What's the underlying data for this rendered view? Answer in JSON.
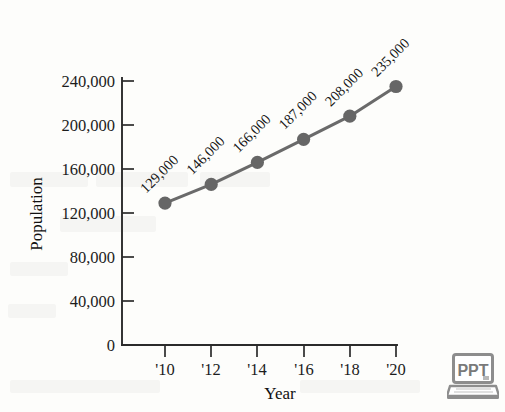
{
  "chart_data": {
    "type": "line",
    "title": "",
    "subtitle": "",
    "xlabel": "Year",
    "ylabel": "Population",
    "categories": [
      "'10",
      "'12",
      "'14",
      "'16",
      "'18",
      "'20"
    ],
    "x": [
      2010,
      2012,
      2014,
      2016,
      2018,
      2020
    ],
    "values": [
      129000,
      146000,
      166000,
      187000,
      208000,
      235000
    ],
    "point_labels": [
      "129,000",
      "146,000",
      "166,000",
      "187,000",
      "208,000",
      "235,000"
    ],
    "series": [
      {
        "name": "Population",
        "values": [
          129000,
          146000,
          166000,
          187000,
          208000,
          235000
        ],
        "color": "#6a6a6a"
      }
    ],
    "ylim": [
      0,
      240000
    ],
    "ytick_values": [
      0,
      40000,
      80000,
      120000,
      160000,
      200000,
      240000
    ],
    "ytick_labels": [
      "0",
      "40,000",
      "80,000",
      "120,000",
      "160,000",
      "200,000",
      "240,000"
    ],
    "xtick_labels": [
      "'10",
      "'12",
      "'14",
      "'16",
      "'18",
      "'20"
    ],
    "grid": false,
    "legend": false,
    "legend_position": "none",
    "point_label_rotation_deg": -45,
    "marker": "circle",
    "line_color": "#6a6a6a",
    "marker_color": "#666666",
    "axis_color": "#2b2b2b",
    "background_color": "#fdfdfb"
  },
  "badge": {
    "label": "PPT",
    "icon": "laptop-icon",
    "color": "#8a8a8a"
  }
}
